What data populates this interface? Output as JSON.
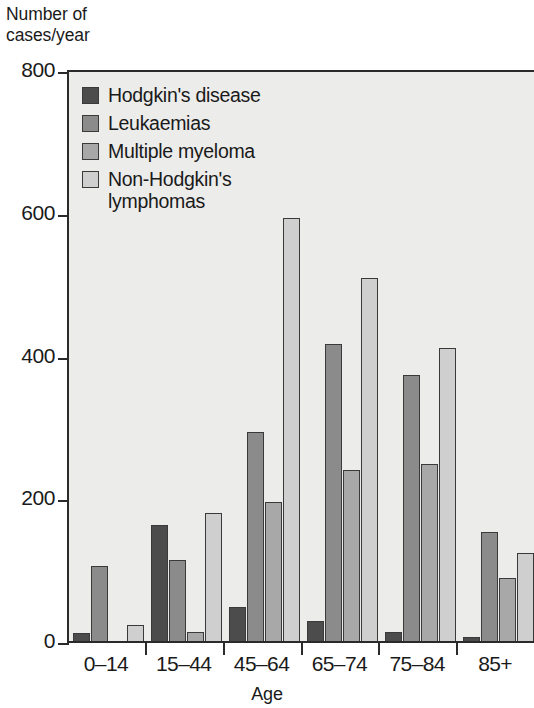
{
  "chart_data": {
    "type": "bar",
    "title": "",
    "ylabel": "Number of\ncases/year",
    "xlabel": "Age",
    "ylim": [
      0,
      800
    ],
    "yticks": [
      0,
      200,
      400,
      600,
      800
    ],
    "ytick_labels": [
      "0",
      "200",
      "400",
      "600",
      "800"
    ],
    "grid": false,
    "legend_position": "top-left inside plot",
    "categories": [
      "0–14",
      "15–44",
      "45–64",
      "65–74",
      "75–84",
      "85+"
    ],
    "series": [
      {
        "name": "Hodgkin's disease",
        "color": "#4c4c4c",
        "values": [
          11,
          163,
          48,
          28,
          12,
          5
        ]
      },
      {
        "name": "Leukaemias",
        "color": "#8b8b8b",
        "values": [
          105,
          114,
          293,
          416,
          373,
          153
        ]
      },
      {
        "name": "Multiple myeloma",
        "color": "#a8a8a8",
        "values": [
          0,
          12,
          195,
          240,
          248,
          88
        ]
      },
      {
        "name": "Non-Hodgkin's\nlymphomas",
        "color": "#cfcfcf",
        "values": [
          23,
          180,
          592,
          508,
          410,
          124
        ]
      }
    ]
  },
  "style": {
    "plot_background": "#ececeb",
    "axis_color": "#2a2a2a",
    "bar_outline": "#3a3a3a",
    "page_background": "#ffffff"
  }
}
